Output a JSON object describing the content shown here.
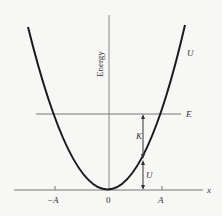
{
  "figure": {
    "y_axis_label": "Energy",
    "x_axis_label": "x",
    "curve_label": "U",
    "energy_line_label": "E",
    "kinetic_label": "K",
    "potential_label": "U",
    "tick_labels": {
      "neg_amplitude": "−A",
      "origin": "0",
      "pos_amplitude": "A"
    },
    "colors": {
      "curve": "#1a1a1a",
      "axes": "#777777",
      "background": "#f7f7f5"
    }
  }
}
